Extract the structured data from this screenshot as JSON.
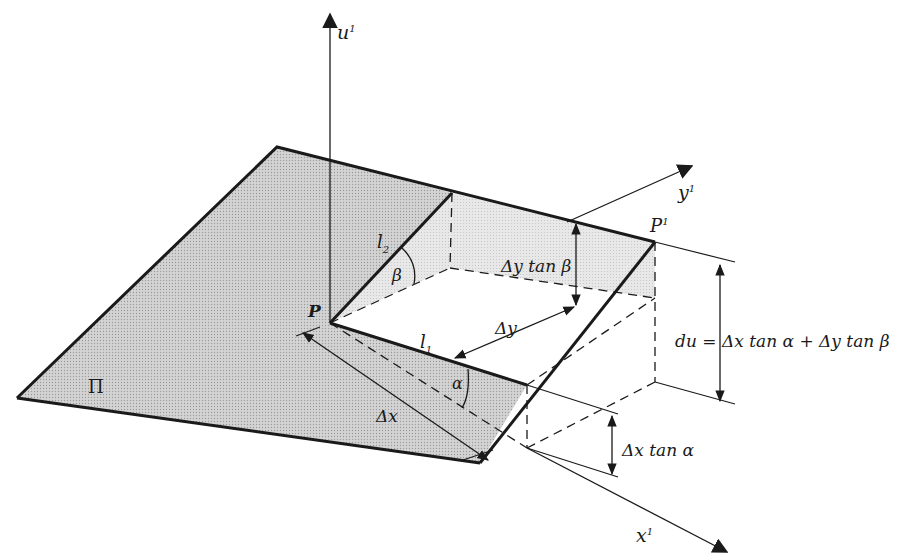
{
  "figure": {
    "fill_color": "#c8c8c8",
    "light_fill_color": "#e2e2e2",
    "stroke_color": "#1a1a1a"
  },
  "axes": {
    "u": {
      "label": "u",
      "superscript": "1"
    },
    "x": {
      "label": "x",
      "superscript": "1"
    },
    "y": {
      "label": "y",
      "superscript": "1"
    }
  },
  "points": {
    "P": {
      "label": "P"
    },
    "P1": {
      "label": "P",
      "superscript": "1"
    }
  },
  "plane": {
    "label": "Π"
  },
  "lines": {
    "l1": {
      "label": "l",
      "subscript": "1"
    },
    "l2": {
      "label": "l",
      "subscript": "2"
    }
  },
  "angles": {
    "alpha": "α",
    "beta": "β"
  },
  "increments": {
    "dx": "Δx",
    "dy": "Δy",
    "dy_tan_beta": "Δy tan β",
    "dx_tan_alpha": "Δx tan α"
  },
  "equation": {
    "lhs": "du",
    "eq": "=",
    "rhs": "Δx tan α + Δy tan β"
  }
}
